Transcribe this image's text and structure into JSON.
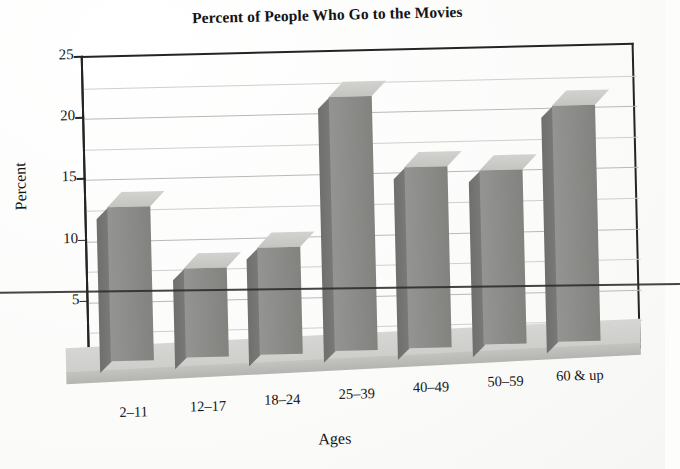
{
  "chart_data": {
    "type": "bar",
    "title": "Percent of People Who Go to the Movies",
    "xlabel": "Ages",
    "ylabel": "Percent",
    "categories": [
      "2–11",
      "12–17",
      "18–24",
      "25–39",
      "40–49",
      "50–59",
      "60 & up"
    ],
    "values": [
      13.8,
      8.5,
      10.0,
      22.0,
      16.0,
      15.5,
      20.5
    ],
    "ylim": [
      0,
      25
    ],
    "ytick_labels": [
      "0",
      "5",
      "10",
      "15",
      "20",
      "25"
    ],
    "ytick_values": [
      0,
      5,
      10,
      15,
      20,
      25
    ],
    "minor_gridline_values": [
      2.5,
      7.5,
      12.5,
      17.5,
      22.5
    ],
    "grid": true,
    "legend": "none",
    "style": "3d-bar",
    "colors": {
      "bar_front": "#8c8c8a",
      "bar_top": "#c8c8c5",
      "bar_side": "#6f6f6d",
      "floor": "#d2d2cf",
      "axis": "#242424",
      "gridline": "#b9b9b9",
      "background": "#fdfdfc"
    }
  }
}
